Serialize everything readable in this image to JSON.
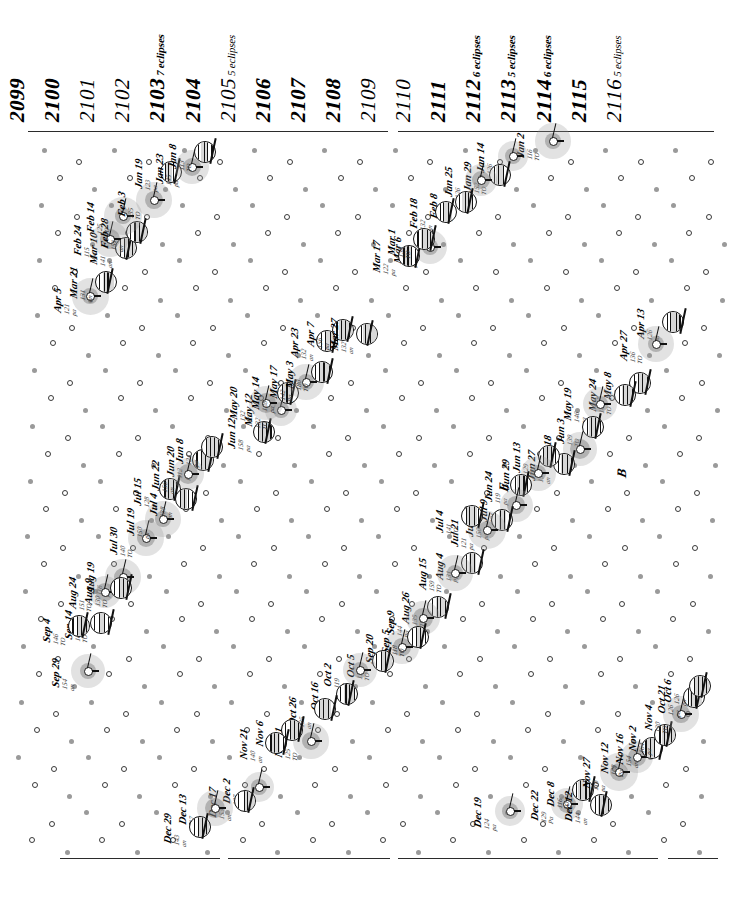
{
  "figure": {
    "kind": "eclipse-calendar",
    "orientation": "rotated-90",
    "span_start": "2099",
    "span_end": "2116"
  },
  "years": [
    {
      "year": "2099",
      "note": "",
      "weight": "bold"
    },
    {
      "year": "2100",
      "note": "",
      "weight": "bold"
    },
    {
      "year": "2101",
      "note": "",
      "weight": "light"
    },
    {
      "year": "2102",
      "note": "",
      "weight": "light"
    },
    {
      "year": "2103",
      "note": "7 eclipses",
      "weight": "bold"
    },
    {
      "year": "2104",
      "note": "",
      "weight": "bold"
    },
    {
      "year": "2105",
      "note": "5 eclipses",
      "weight": "light"
    },
    {
      "year": "2106",
      "note": "",
      "weight": "bold"
    },
    {
      "year": "2107",
      "note": "",
      "weight": "bold"
    },
    {
      "year": "2108",
      "note": "",
      "weight": "bold"
    },
    {
      "year": "2109",
      "note": "",
      "weight": "light"
    },
    {
      "year": "2110",
      "note": "",
      "weight": "light"
    },
    {
      "year": "2111",
      "note": "",
      "weight": "bold"
    },
    {
      "year": "2112",
      "note": "6 eclipses",
      "weight": "bold"
    },
    {
      "year": "2113",
      "note": "5 eclipses",
      "weight": "bold"
    },
    {
      "year": "2114",
      "note": "6 eclipses",
      "weight": "bold"
    },
    {
      "year": "2115",
      "note": "",
      "weight": "bold"
    },
    {
      "year": "2116",
      "note": "5 eclipses",
      "weight": "light"
    }
  ],
  "annotations": [
    {
      "text": "E",
      "x": 512,
      "y": 477
    },
    {
      "text": "B",
      "x": 630,
      "y": 463
    }
  ],
  "separators": [
    {
      "x": 28,
      "y": 131,
      "len": 360
    },
    {
      "x": 398,
      "y": 131,
      "len": 170
    },
    {
      "x": 568,
      "y": 131,
      "len": 146
    },
    {
      "x": 60,
      "y": 858,
      "len": 160
    },
    {
      "x": 228,
      "y": 858,
      "len": 162
    },
    {
      "x": 398,
      "y": 858,
      "len": 260
    },
    {
      "x": 668,
      "y": 858,
      "len": 50
    }
  ],
  "events": [
    {
      "date": "Sep 29",
      "saros": "154",
      "type": "an",
      "kind": "solar",
      "x": 88,
      "y": 671
    },
    {
      "date": "Sep 14",
      "saros": "161",
      "type": "TO",
      "kind": "lunar",
      "x": 101,
      "y": 623
    },
    {
      "date": "Sep 4",
      "saros": "146",
      "type": "TO",
      "kind": "lunar",
      "x": 79,
      "y": 626
    },
    {
      "date": "Aug 19",
      "saros": "116",
      "type": "pa",
      "kind": "solar",
      "x": 123,
      "y": 577
    },
    {
      "date": "Aug 24",
      "saros": "151",
      "type": "TO",
      "kind": "solar",
      "x": 105,
      "y": 592
    },
    {
      "date": "Aug 9",
      "saros": "130",
      "type": "TO",
      "kind": "lunar",
      "x": 121,
      "y": 588
    },
    {
      "date": "Jul 30",
      "saros": "140",
      "type": "TO",
      "kind": "solar",
      "x": 146,
      "y": 538
    },
    {
      "date": "Jul 19",
      "saros": "150",
      "type": "pa",
      "kind": "solar",
      "x": 163,
      "y": 519
    },
    {
      "date": "Jul 15",
      "saros": "128",
      "type": "an",
      "kind": "lunar",
      "x": 170,
      "y": 489
    },
    {
      "date": "Jul 4",
      "saros": "138",
      "type": "an",
      "kind": "lunar",
      "x": 186,
      "y": 499
    },
    {
      "date": "Jun 20",
      "saros": "112",
      "type": "pa",
      "kind": "lunar",
      "x": 203,
      "y": 460
    },
    {
      "date": "Jun 22",
      "saros": "156",
      "type": "an",
      "kind": "solar",
      "x": 188,
      "y": 474
    },
    {
      "date": "Jun 8",
      "saros": "124",
      "type": "pa",
      "kind": "lunar",
      "x": 212,
      "y": 447
    },
    {
      "date": "Jun 12",
      "saros": "158",
      "type": "pa",
      "kind": "lunar",
      "x": 264,
      "y": 432
    },
    {
      "date": "May 12",
      "saros": "132",
      "type": "TO",
      "kind": "solar",
      "x": 281,
      "y": 410
    },
    {
      "date": "May 20",
      "saros": "132",
      "type": "TO",
      "kind": "solar",
      "x": 266,
      "y": 403
    },
    {
      "date": "May 14",
      "saros": "128",
      "type": "pa",
      "kind": "lunar",
      "x": 288,
      "y": 393
    },
    {
      "date": "May 17",
      "saros": "142",
      "type": "Pa",
      "kind": "solar",
      "x": 306,
      "y": 382
    },
    {
      "date": "May 3",
      "saros": "180",
      "type": "TO",
      "kind": "lunar",
      "x": 322,
      "y": 372
    },
    {
      "date": "Apr 23",
      "saros": "132",
      "type": "an",
      "kind": "lunar",
      "x": 327,
      "y": 341
    },
    {
      "date": "Apr 7",
      "saros": "156",
      "type": "pa",
      "kind": "lunar",
      "x": 343,
      "y": 330
    },
    {
      "date": "Apr 5",
      "saros": "121",
      "type": "pa",
      "kind": "solar",
      "x": 90,
      "y": 296
    },
    {
      "date": "Mar 21",
      "saros": "131",
      "type": "an",
      "kind": "lunar",
      "x": 106,
      "y": 282
    },
    {
      "date": "Mar 10",
      "saros": "141",
      "type": "an",
      "kind": "lunar",
      "x": 126,
      "y": 248
    },
    {
      "date": "Feb 24",
      "saros": "115",
      "type": "pa",
      "kind": "solar",
      "x": 110,
      "y": 239
    },
    {
      "date": "Feb 28",
      "saros": "151",
      "type": "an",
      "kind": "lunar",
      "x": 137,
      "y": 232
    },
    {
      "date": "Feb 14",
      "saros": "125",
      "type": "TO",
      "kind": "solar",
      "x": 123,
      "y": 216
    },
    {
      "date": "Feb 3",
      "saros": "135",
      "type": "TO",
      "kind": "solar",
      "x": 154,
      "y": 200
    },
    {
      "date": "Jan 19",
      "saros": "123",
      "type": "pa",
      "kind": "lunar",
      "x": 171,
      "y": 172
    },
    {
      "date": "Jan 23",
      "saros": "145",
      "type": "pa",
      "kind": "solar",
      "x": 192,
      "y": 167
    },
    {
      "date": "Jan 8",
      "saros": "113",
      "type": "TO",
      "kind": "lunar",
      "x": 205,
      "y": 152
    },
    {
      "date": "Jan 2",
      "saros": "116",
      "type": "TO",
      "kind": "solar",
      "x": 553,
      "y": 141
    },
    {
      "date": "Jan 14",
      "saros": "126",
      "type": "Pa",
      "kind": "solar",
      "x": 513,
      "y": 156
    },
    {
      "date": "Jan 29",
      "saros": "152",
      "type": "TO",
      "kind": "lunar",
      "x": 500,
      "y": 175
    },
    {
      "date": "Jan 25",
      "saros": "126",
      "type": "pa",
      "kind": "solar",
      "x": 481,
      "y": 180
    },
    {
      "date": "Feb 8",
      "saros": "142",
      "type": "TO",
      "kind": "lunar",
      "x": 466,
      "y": 202
    },
    {
      "date": "Feb 18",
      "saros": "132",
      "type": "an",
      "kind": "lunar",
      "x": 446,
      "y": 212
    },
    {
      "date": "Mar 6",
      "saros": "148",
      "type": "pa",
      "kind": "solar",
      "x": 430,
      "y": 247
    },
    {
      "date": "Mar 17",
      "saros": "122",
      "type": "pa",
      "kind": "lunar",
      "x": 409,
      "y": 256
    },
    {
      "date": "Mar 1",
      "saros": "138",
      "type": "TO",
      "kind": "lunar",
      "x": 424,
      "y": 239
    },
    {
      "date": "Mar 27",
      "saros": "132",
      "type": "an",
      "kind": "lunar",
      "x": 367,
      "y": 334
    },
    {
      "date": "Apr 13",
      "saros": "126",
      "type": "pa",
      "kind": "lunar",
      "x": 673,
      "y": 322
    },
    {
      "date": "Apr 27",
      "saros": "136",
      "type": "TO",
      "kind": "solar",
      "x": 656,
      "y": 344
    },
    {
      "date": "May 8",
      "saros": "146",
      "type": "TO",
      "kind": "lunar",
      "x": 640,
      "y": 383
    },
    {
      "date": "May 24",
      "saros": "140",
      "type": "TO",
      "kind": "lunar",
      "x": 625,
      "y": 395
    },
    {
      "date": "May 19",
      "saros": "146",
      "type": "pa",
      "kind": "solar",
      "x": 600,
      "y": 404
    },
    {
      "date": "Jun 3",
      "saros": "139",
      "type": "TO",
      "kind": "lunar",
      "x": 593,
      "y": 427
    },
    {
      "date": "Jun 18",
      "saros": "157",
      "type": "pa",
      "kind": "solar",
      "x": 580,
      "y": 449
    },
    {
      "date": "Jun 27",
      "saros": "151",
      "type": "an",
      "kind": "lunar",
      "x": 564,
      "y": 464
    },
    {
      "date": "Jun 13",
      "saros": "129",
      "type": "TO",
      "kind": "lunar",
      "x": 549,
      "y": 456
    },
    {
      "date": "Jun 29",
      "saros": "147",
      "type": "Pa",
      "kind": "solar",
      "x": 538,
      "y": 473
    },
    {
      "date": "Jun 24",
      "saros": "119",
      "type": "pa",
      "kind": "lunar",
      "x": 521,
      "y": 485
    },
    {
      "date": "Jul 9",
      "saros": "131",
      "type": "TO",
      "kind": "solar",
      "x": 516,
      "y": 505
    },
    {
      "date": "Jul 23",
      "saros": "150",
      "type": "pa",
      "kind": "lunar",
      "x": 502,
      "y": 520
    },
    {
      "date": "Jul 21",
      "saros": "121",
      "type": "pa",
      "kind": "solar",
      "x": 487,
      "y": 530
    },
    {
      "date": "Jul 4",
      "saros": "141",
      "type": "TO",
      "kind": "lunar",
      "x": 472,
      "y": 516
    },
    {
      "date": "Aug 4",
      "saros": "131",
      "type": "Pa",
      "kind": "lunar",
      "x": 472,
      "y": 563
    },
    {
      "date": "Aug 15",
      "saros": "159",
      "type": "TO",
      "kind": "solar",
      "x": 455,
      "y": 573
    },
    {
      "date": "Aug 26",
      "saros": "135",
      "type": "TO",
      "kind": "lunar",
      "x": 438,
      "y": 607
    },
    {
      "date": "Sep 9",
      "saros": "144",
      "type": "Pa",
      "kind": "solar",
      "x": 423,
      "y": 618
    },
    {
      "date": "Sep 20",
      "saros": "129",
      "type": "Pa",
      "kind": "solar",
      "x": 402,
      "y": 647
    },
    {
      "date": "Sep 5",
      "saros": "118",
      "type": "TO",
      "kind": "lunar",
      "x": 418,
      "y": 637
    },
    {
      "date": "Oct 5",
      "saros": "135",
      "type": "TO",
      "kind": "lunar",
      "x": 383,
      "y": 661
    },
    {
      "date": "Oct 2",
      "saros": "119",
      "type": "pa",
      "kind": "solar",
      "x": 360,
      "y": 670
    },
    {
      "date": "Oct 16",
      "saros": "146",
      "type": "TO",
      "kind": "lunar",
      "x": 347,
      "y": 694
    },
    {
      "date": "Oct 26",
      "saros": "135",
      "type": "an",
      "kind": "lunar",
      "x": 325,
      "y": 709
    },
    {
      "date": "Nov 11",
      "saros": "125",
      "type": "TO",
      "kind": "solar",
      "x": 311,
      "y": 741
    },
    {
      "date": "Nov 6",
      "saros": "123",
      "type": "TO",
      "kind": "lunar",
      "x": 292,
      "y": 730
    },
    {
      "date": "Nov 21",
      "saros": "140",
      "type": "an",
      "kind": "lunar",
      "x": 276,
      "y": 743
    },
    {
      "date": "Dec 2",
      "saros": "127",
      "type": "Pa",
      "kind": "solar",
      "x": 259,
      "y": 787
    },
    {
      "date": "Dec 17",
      "saros": "153",
      "type": "an",
      "kind": "lunar",
      "x": 245,
      "y": 801
    },
    {
      "date": "Dec 13",
      "saros": "117",
      "type": "pa",
      "kind": "solar",
      "x": 215,
      "y": 808
    },
    {
      "date": "Dec 29",
      "saros": "143",
      "type": "an",
      "kind": "lunar",
      "x": 200,
      "y": 827
    },
    {
      "date": "Dec 19",
      "saros": "124",
      "type": "pa",
      "kind": "solar",
      "x": 510,
      "y": 811
    },
    {
      "date": "Dec 22",
      "saros": "129",
      "type": "Pa",
      "kind": "solar",
      "x": 567,
      "y": 804
    },
    {
      "date": "Dec 8",
      "saros": "116",
      "type": "TO",
      "kind": "lunar",
      "x": 583,
      "y": 790
    },
    {
      "date": "Dec 12",
      "saros": "144",
      "type": "an",
      "kind": "lunar",
      "x": 601,
      "y": 805
    },
    {
      "date": "Nov 27",
      "saros": "118",
      "type": "pa",
      "kind": "solar",
      "x": 619,
      "y": 772
    },
    {
      "date": "Nov 12",
      "saros": "128",
      "type": "Pa",
      "kind": "solar",
      "x": 637,
      "y": 757
    },
    {
      "date": "Nov 16",
      "saros": "154",
      "type": "an",
      "kind": "lunar",
      "x": 652,
      "y": 748
    },
    {
      "date": "Nov 2",
      "saros": "164",
      "type": "pa",
      "kind": "lunar",
      "x": 665,
      "y": 735
    },
    {
      "date": "Nov 4",
      "saros": "130",
      "type": "TO",
      "kind": "solar",
      "x": 681,
      "y": 714
    },
    {
      "date": "Oct 21",
      "saros": "126",
      "type": "pa",
      "kind": "lunar",
      "x": 694,
      "y": 697
    },
    {
      "date": "Oct 6",
      "saros": "126",
      "type": "pa",
      "kind": "lunar",
      "x": 700,
      "y": 686
    }
  ]
}
